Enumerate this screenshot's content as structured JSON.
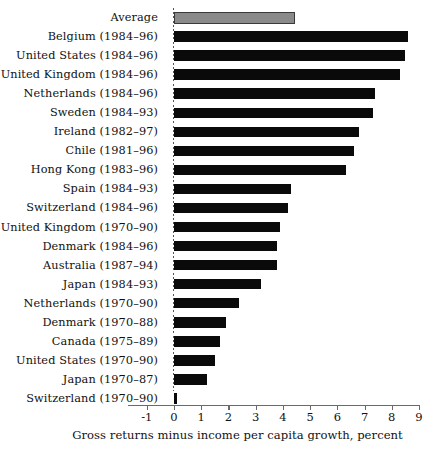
{
  "chart_data": {
    "type": "bar",
    "orientation": "horizontal",
    "title": "",
    "xlabel": "Gross returns minus income per capita growth, percent",
    "ylabel": "",
    "xlim": [
      -1,
      9
    ],
    "xticks": [
      "-1",
      "0",
      "1",
      "2",
      "3",
      "4",
      "5",
      "6",
      "7",
      "8",
      "9"
    ],
    "grid": false,
    "legend": "none",
    "zero_reference_line": true,
    "categories": [
      "Average",
      "Belgium (1984–96)",
      "United States (1984–96)",
      "United Kingdom (1984–96)",
      "Netherlands (1984–96)",
      "Sweden (1984–93)",
      "Ireland (1982–97)",
      "Chile (1981–96)",
      "Hong Kong (1983–96)",
      "Spain (1984–93)",
      "Switzerland (1984–96)",
      "United Kingdom (1970–90)",
      "Denmark (1984–96)",
      "Australia (1987–94)",
      "Japan (1984–93)",
      "Netherlands (1970–90)",
      "Denmark (1970–88)",
      "Canada (1975–89)",
      "United States (1970–90)",
      "Japan (1970–87)",
      "Switzerland (1970–90)"
    ],
    "values": [
      4.45,
      8.6,
      8.5,
      8.3,
      7.4,
      7.3,
      6.8,
      6.6,
      6.3,
      4.3,
      4.2,
      3.9,
      3.8,
      3.8,
      3.2,
      2.4,
      1.9,
      1.7,
      1.5,
      1.2,
      0.1
    ],
    "highlight_index": 0,
    "colors": {
      "bar": "#0a0a0a",
      "average_bar": "#8a8a8a",
      "average_border": "#3a3a3a",
      "axis": "#6a6a6a",
      "text": "#111111",
      "background": "#ffffff"
    }
  }
}
